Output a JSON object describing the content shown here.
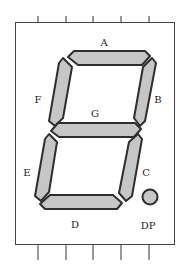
{
  "diagram": {
    "segments": [
      {
        "id": "A",
        "label": "A"
      },
      {
        "id": "B",
        "label": "B"
      },
      {
        "id": "C",
        "label": "C"
      },
      {
        "id": "D",
        "label": "D"
      },
      {
        "id": "E",
        "label": "E"
      },
      {
        "id": "F",
        "label": "F"
      },
      {
        "id": "G",
        "label": "G"
      }
    ],
    "decimal_point": {
      "label": "DP"
    },
    "pins": {
      "top_count": 5,
      "bottom_count": 5
    },
    "colors": {
      "segment_fill": "#c6c6c6",
      "segment_stroke": "#2e2e2e",
      "frame": "#444444"
    }
  }
}
